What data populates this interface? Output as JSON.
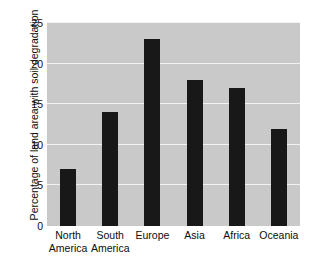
{
  "chart": {
    "title": "",
    "ylabel": "Percentage of land area with soil degradation",
    "xlabel": "",
    "colors": {
      "bar": "#181818",
      "plot_background": "#c9c9c9",
      "gridline": "#f2f2f2",
      "page_background": "#ffffff",
      "text": "#0d0d0d"
    }
  },
  "chart_data": {
    "type": "bar",
    "title": "",
    "xlabel": "",
    "ylabel": "Percentage of land area with soil degradation",
    "categories": [
      "North America",
      "South America",
      "Europe",
      "Asia",
      "Africa",
      "Oceania"
    ],
    "category_lines": [
      [
        "North",
        "America"
      ],
      [
        "South",
        "America"
      ],
      [
        "Europe"
      ],
      [
        "Asia"
      ],
      [
        "Africa"
      ],
      [
        "Oceania"
      ]
    ],
    "values": [
      7,
      14,
      23,
      18,
      17,
      12
    ],
    "ylim": [
      0,
      25
    ],
    "yticks": [
      0,
      5,
      10,
      15,
      20,
      25
    ],
    "ytick_labels": [
      "0",
      "5",
      "10",
      "15",
      "20",
      "25"
    ],
    "grid": true,
    "grid_axis": "y",
    "legend": false,
    "legend_position": "none"
  }
}
